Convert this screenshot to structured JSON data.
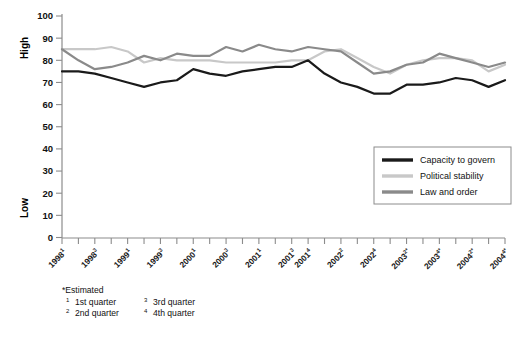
{
  "chart_data": {
    "type": "line",
    "title": "",
    "xlabel": "",
    "ylabel": "",
    "ylim": [
      0,
      100
    ],
    "ytick_labels": [
      "0",
      "10",
      "20",
      "30",
      "40",
      "50",
      "60",
      "70",
      "80",
      "90",
      "100"
    ],
    "yaxis_high_label": "High",
    "yaxis_low_label": "Low",
    "grid": false,
    "legend_position": "inside-right",
    "categories": [
      "1998¹",
      "1998²",
      "1998³",
      "1998⁴",
      "1999¹",
      "1999²",
      "1999³",
      "1999⁴",
      "2000¹",
      "2000²",
      "2000³",
      "2000⁴",
      "2001¹",
      "2001²",
      "2001³",
      "2001⁴",
      "2002¹",
      "2002²",
      "2002³",
      "2002⁴",
      "2003¹*",
      "2003²*",
      "2003³*",
      "2003⁴*",
      "2004¹*",
      "2004²*",
      "2004³*",
      "2004⁴*"
    ],
    "xtick_labels_shown": [
      {
        "year": "1998",
        "sup": "1"
      },
      {
        "year": "1998",
        "sup": "3"
      },
      {
        "year": "1999",
        "sup": "1"
      },
      {
        "year": "1999",
        "sup": "3"
      },
      {
        "year": "2000",
        "sup": "1"
      },
      {
        "year": "2000",
        "sup": "3"
      },
      {
        "year": "2001",
        "sup": "1"
      },
      {
        "year": "2001",
        "sup": "3"
      },
      {
        "year": "2001",
        "sup": "4"
      },
      {
        "year": "2002",
        "sup": "2"
      },
      {
        "year": "2002",
        "sup": "4"
      },
      {
        "year": "2003",
        "sup": "2*"
      },
      {
        "year": "2003",
        "sup": "4*"
      },
      {
        "year": "2004",
        "sup": "2*"
      },
      {
        "year": "2004",
        "sup": "4*"
      }
    ],
    "series": [
      {
        "name": "Capacity to govern",
        "color": "#1a1a1a",
        "values": [
          75,
          75,
          74,
          72,
          70,
          68,
          70,
          71,
          76,
          74,
          73,
          75,
          76,
          77,
          77,
          80,
          74,
          70,
          68,
          65,
          65,
          69,
          69,
          70,
          72,
          71,
          68,
          71
        ]
      },
      {
        "name": "Political stability",
        "color": "#c8c8c8",
        "values": [
          85,
          85,
          85,
          86,
          84,
          79,
          81,
          80,
          80,
          80,
          79,
          79,
          79,
          79,
          80,
          80,
          84,
          85,
          81,
          77,
          74,
          78,
          80,
          81,
          81,
          80,
          75,
          78
        ]
      },
      {
        "name": "Law and order",
        "color": "#8a8a8a",
        "values": [
          85,
          80,
          76,
          77,
          79,
          82,
          80,
          83,
          82,
          82,
          86,
          84,
          87,
          85,
          84,
          86,
          85,
          84,
          79,
          74,
          75,
          78,
          79,
          83,
          81,
          79,
          77,
          79
        ]
      }
    ],
    "legend": [
      {
        "label": "Capacity to govern",
        "color": "#1a1a1a"
      },
      {
        "label": "Political stability",
        "color": "#c8c8c8"
      },
      {
        "label": "Law and order",
        "color": "#8a8a8a"
      }
    ],
    "footnotes": {
      "estimated": "*Estimated",
      "quarters": [
        {
          "sup": "1",
          "text": "1st quarter"
        },
        {
          "sup": "2",
          "text": "2nd quarter"
        },
        {
          "sup": "3",
          "text": "3rd quarter"
        },
        {
          "sup": "4",
          "text": "4th quarter"
        }
      ]
    }
  }
}
